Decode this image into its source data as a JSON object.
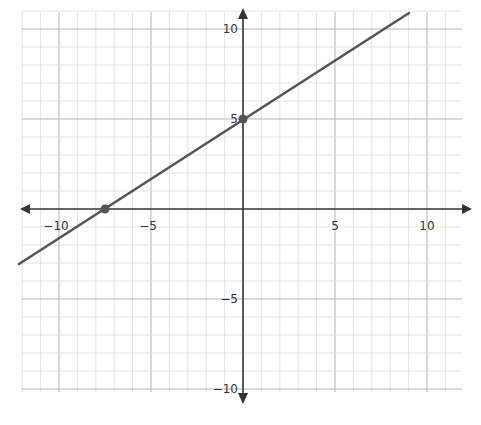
{
  "chart_data": {
    "type": "line",
    "title": "",
    "xlabel": "",
    "ylabel": "",
    "xlim": [
      -12,
      12
    ],
    "ylim": [
      -10.5,
      11
    ],
    "grid": true,
    "grid_minor_step": 1,
    "grid_major_step": 5,
    "x_tick_labels": [
      "−10",
      "−5",
      "5",
      "10"
    ],
    "x_tick_values": [
      -10,
      -5,
      5,
      10
    ],
    "y_tick_labels": [
      "10",
      "5",
      "−5",
      "−10"
    ],
    "y_tick_values": [
      10,
      5,
      -5,
      -10
    ],
    "series": [
      {
        "name": "line",
        "equation": "y = (2/3)x + 5",
        "slope": 0.6667,
        "intercept": 5,
        "x": [
          -12.2,
          9.0
        ],
        "y": [
          -3.1,
          11.0
        ],
        "color": "#555555"
      }
    ],
    "points": [
      {
        "label": "x-intercept",
        "x": -7.5,
        "y": 0
      },
      {
        "label": "y-intercept",
        "x": 0,
        "y": 5
      }
    ],
    "colors": {
      "axis": "#333333",
      "line": "#555555",
      "point": "#555555",
      "grid_minor": "#dddddd",
      "grid_major": "#b5b5b5"
    }
  }
}
